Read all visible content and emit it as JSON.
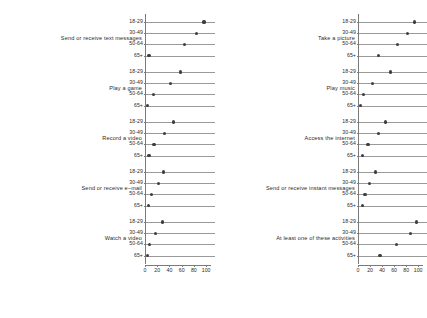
{
  "chart_data": {
    "type": "scatter",
    "chart_style": "cleveland-dot-plot",
    "title": "",
    "subtitle": "",
    "xlabel": "",
    "ylabel": "",
    "xlim": [
      0,
      108
    ],
    "xticks": [
      0,
      20,
      40,
      60,
      80,
      100
    ],
    "xtick_labels": [
      "0",
      "20",
      "40",
      "60",
      "80",
      "100"
    ],
    "categories": [
      "18-29",
      "30-49",
      "50-64",
      "65+"
    ],
    "grid": true,
    "legend": "none",
    "marker": "filled-circle",
    "marker_color": "#3d3d3d",
    "gridline_color": "#9a9a9a",
    "axis_color": "#7a7a7a",
    "background": "#ffffff",
    "panels": [
      {
        "column": "left",
        "order": 1,
        "label": "Send or receive text messages",
        "values": [
          95,
          82,
          63,
          5
        ]
      },
      {
        "column": "left",
        "order": 2,
        "label": "Play a game",
        "values": [
          57,
          40,
          12,
          3
        ]
      },
      {
        "column": "left",
        "order": 3,
        "label": "Record a video",
        "values": [
          45,
          30,
          13,
          5
        ]
      },
      {
        "column": "left",
        "order": 4,
        "label": "Send or receive e–mail",
        "values": [
          29,
          20,
          9,
          4
        ]
      },
      {
        "column": "left",
        "order": 5,
        "label": "Watch a video",
        "values": [
          27,
          16,
          6,
          3
        ]
      },
      {
        "column": "right",
        "order": 1,
        "label": "Take a picture",
        "values": [
          92,
          80,
          64,
          33
        ]
      },
      {
        "column": "right",
        "order": 2,
        "label": "Play music",
        "values": [
          52,
          22,
          8,
          3
        ]
      },
      {
        "column": "right",
        "order": 3,
        "label": "Access the internet",
        "values": [
          44,
          32,
          15,
          6
        ]
      },
      {
        "column": "right",
        "order": 4,
        "label": "Send or receive instant messages",
        "values": [
          28,
          17,
          10,
          6
        ]
      },
      {
        "column": "right",
        "order": 5,
        "label": "At least one of these activities",
        "values": [
          96,
          85,
          62,
          35
        ]
      }
    ]
  }
}
